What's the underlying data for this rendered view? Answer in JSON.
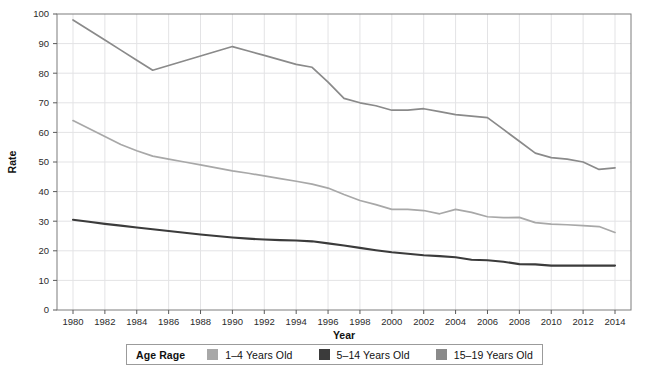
{
  "top_cut_text": "",
  "chart_data": {
    "type": "line",
    "title": "",
    "xlabel": "Year",
    "ylabel": "Rate",
    "xlim": [
      1980,
      2014
    ],
    "ylim": [
      0,
      100
    ],
    "grid": true,
    "legend_position": "bottom",
    "legend_title": "Age Rage",
    "xticks": [
      1980,
      1982,
      1984,
      1986,
      1988,
      1990,
      1992,
      1994,
      1996,
      1998,
      2000,
      2002,
      2004,
      2006,
      2008,
      2010,
      2012,
      2014
    ],
    "yticks": [
      0,
      10,
      20,
      30,
      40,
      50,
      60,
      70,
      80,
      90,
      100
    ],
    "x": [
      1980,
      1981,
      1982,
      1983,
      1984,
      1985,
      1986,
      1987,
      1988,
      1989,
      1990,
      1991,
      1992,
      1993,
      1994,
      1995,
      1996,
      1997,
      1998,
      1999,
      2000,
      2001,
      2002,
      2003,
      2004,
      2005,
      2006,
      2007,
      2008,
      2009,
      2010,
      2011,
      2012,
      2013,
      2014
    ],
    "series": [
      {
        "name": "1–4 Years Old",
        "color": "#a8a8a8",
        "values": [
          64.0,
          61.3,
          58.6,
          55.9,
          53.8,
          52.0,
          51.0,
          50.0,
          49.0,
          48.0,
          47.0,
          46.2,
          45.3,
          44.4,
          43.5,
          42.5,
          41.2,
          39.0,
          37.0,
          35.6,
          34.0,
          34.0,
          33.6,
          32.5,
          34.0,
          33.0,
          31.5,
          31.2,
          31.3,
          29.5,
          29.0,
          28.8,
          28.5,
          28.2,
          26.2
        ]
      },
      {
        "name": "5–14 Years Old",
        "color": "#3b3b3b",
        "values": [
          30.5,
          29.8,
          29.1,
          28.5,
          27.9,
          27.3,
          26.7,
          26.1,
          25.5,
          25.0,
          24.5,
          24.1,
          23.8,
          23.6,
          23.5,
          23.2,
          22.5,
          21.8,
          21.0,
          20.2,
          19.5,
          19.0,
          18.5,
          18.2,
          17.8,
          17.0,
          16.8,
          16.3,
          15.5,
          15.4,
          15.0,
          15.0,
          15.0,
          15.0,
          15.0
        ]
      },
      {
        "name": "15–19 Years Old",
        "color": "#8a8a8a",
        "values": [
          98.0,
          94.6,
          91.2,
          87.8,
          84.4,
          81.0,
          82.6,
          84.2,
          85.8,
          87.4,
          89.0,
          87.5,
          86.0,
          84.5,
          83.0,
          82.0,
          77.0,
          71.5,
          70.0,
          69.0,
          67.5,
          67.5,
          68.0,
          67.0,
          66.0,
          65.5,
          65.0,
          61.0,
          57.0,
          53.0,
          51.5,
          51.0,
          50.0,
          47.5,
          48.0
        ]
      }
    ]
  },
  "legend": {
    "title": "Age Rage",
    "items": [
      {
        "label": "1–4 Years Old",
        "color": "#a8a8a8"
      },
      {
        "label": "5–14 Years Old",
        "color": "#3b3b3b"
      },
      {
        "label": "15–19 Years Old",
        "color": "#8a8a8a"
      }
    ]
  }
}
